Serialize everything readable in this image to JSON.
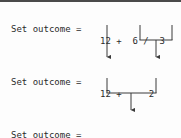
{
  "figure": {
    "background_color": "#fdfdfd",
    "text_color": "#2b2b2b",
    "rule_color": "#4a4a4a",
    "connector_color": "#3a3a3a"
  },
  "lines": [
    {
      "id": "line-1",
      "label": "Set outcome =",
      "expression": "12 +  6 /  3",
      "tokens": [
        "12",
        "+",
        "6",
        "/",
        "3"
      ]
    },
    {
      "id": "line-2",
      "label": "Set outcome =",
      "expression": "12 +     2",
      "tokens": [
        "12",
        "+",
        "2"
      ]
    },
    {
      "id": "line-3",
      "label": "Set outcome =",
      "expression": "   14",
      "tokens": [
        "14"
      ]
    }
  ],
  "connectors": {
    "step1": {
      "description": "12 passes straight down; 6 / 3 bracket reduces to 2",
      "passthrough_x": 107,
      "bracket_left_x": 140,
      "bracket_right_x": 172,
      "bracket_merge_x": 156,
      "bracket_top_y": 25,
      "bracket_bar_y": 40,
      "arrow_y": 60
    },
    "step2": {
      "description": "12 + 2 bracket reduces to 14",
      "bracket_left_x": 107,
      "bracket_right_x": 156,
      "bracket_merge_x": 131,
      "bracket_top_y": 78,
      "bracket_bar_y": 93,
      "arrow_y": 113
    }
  }
}
